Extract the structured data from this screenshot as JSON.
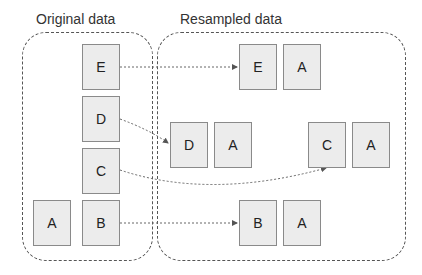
{
  "diagram": {
    "original": {
      "label": "Original data",
      "boxes": [
        "E",
        "D",
        "C",
        "A",
        "B"
      ]
    },
    "resampled": {
      "label": "Resampled data",
      "pairs": [
        {
          "left": "E",
          "right": "A"
        },
        {
          "left": "D",
          "right": "A"
        },
        {
          "left": "C",
          "right": "A"
        },
        {
          "left": "B",
          "right": "A"
        }
      ]
    },
    "arrows": [
      {
        "from": "E",
        "to": "E (resampled)"
      },
      {
        "from": "D",
        "to": "D (resampled)"
      },
      {
        "from": "C",
        "to": "C (resampled)"
      },
      {
        "from": "B",
        "to": "B (resampled)"
      }
    ],
    "colors": {
      "box_fill": "#ececec",
      "box_border": "#8a8a8a",
      "dashed_line": "#555555"
    }
  }
}
